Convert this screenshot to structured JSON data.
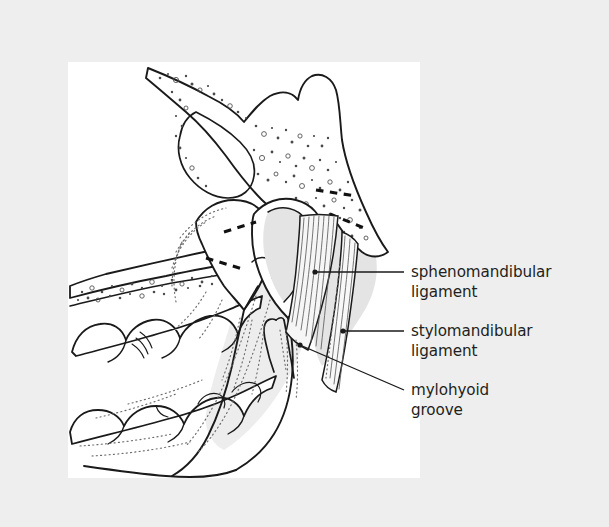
{
  "figure": {
    "kind": "anatomical-line-drawing",
    "orientation": "lateral-medial sagittal section",
    "page_background_color": "#eeeeee",
    "panel_background_color": "#ffffff",
    "ink_color": "#1a1a1a",
    "label_text_color": "#231f20",
    "shading_color": "#e4e4e4",
    "stipple_color": "#4a4a4a",
    "dotted_line_color": "#6d6d6d"
  },
  "annotations": [
    {
      "id": "sphenomandibular-ligament",
      "line1": "sphenomandibular",
      "line2": "ligament",
      "text_x": 411,
      "text_y": 277,
      "leader": {
        "x1": 315,
        "y1": 272,
        "x2": 404,
        "y2": 272
      },
      "dot": {
        "cx": 315,
        "cy": 272,
        "r": 2.6
      }
    },
    {
      "id": "stylomandibular-ligament",
      "line1": "stylomandibular",
      "line2": "ligament",
      "text_x": 411,
      "text_y": 336,
      "leader": {
        "x1": 343,
        "y1": 331,
        "x2": 404,
        "y2": 331
      },
      "dot": {
        "cx": 343,
        "cy": 331,
        "r": 2.6
      }
    },
    {
      "id": "mylohyoid-groove",
      "line1": "mylohyoid",
      "line2": "groove",
      "text_x": 411,
      "text_y": 395,
      "leader": {
        "x1": 300,
        "y1": 345,
        "x2": 404,
        "y2": 390
      },
      "dot": {
        "cx": 300,
        "cy": 345,
        "r": 2.6
      }
    }
  ],
  "structures": [
    {
      "name": "sphenoid-bone",
      "feature": "cancellous stipple body, upper skull base"
    },
    {
      "name": "maxilla",
      "feature": "upper jaw with cancellous stipple"
    },
    {
      "name": "upper-molars",
      "feature": "maxillary molar row"
    },
    {
      "name": "lower-molars",
      "feature": "mandibular molar row"
    },
    {
      "name": "mandibular-ramus",
      "feature": "vertical ramus, medial surface"
    },
    {
      "name": "coronoid-process",
      "feature": "anterior superior process of ramus"
    },
    {
      "name": "condylar-process",
      "feature": "posterior superior process of ramus"
    },
    {
      "name": "mandibular-body",
      "feature": "horizontal body of mandible"
    },
    {
      "name": "mylohyoid-groove",
      "feature": "elongated groove on medial ramus"
    },
    {
      "name": "sphenomandibular-ligament",
      "feature": "broad fiber band from spine of sphenoid to lingula"
    },
    {
      "name": "stylomandibular-ligament",
      "feature": "narrow fiber band from styloid process to angle"
    },
    {
      "name": "cut-plane-markers",
      "feature": "heavy dashed section markers"
    }
  ]
}
